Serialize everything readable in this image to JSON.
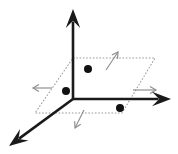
{
  "figure": {
    "background_color": "#ffffff",
    "width": 178,
    "height": 154
  },
  "chart_data": {
    "type": "scatter",
    "xlabel": "",
    "ylabel": "",
    "zlabel": "",
    "projection": "3d-oblique",
    "grid": false,
    "legend": null,
    "origin": {
      "x": 73,
      "y": 99
    },
    "axes": [
      {
        "name": "vertical-axis",
        "label": "",
        "color": "#1a1a1a",
        "from": {
          "x": 73,
          "y": 99
        },
        "to": {
          "x": 73,
          "y": 9
        },
        "arrow": "up",
        "style": "solid-thick"
      },
      {
        "name": "horizontal-axis",
        "label": "",
        "color": "#1a1a1a",
        "from": {
          "x": 73,
          "y": 99
        },
        "to": {
          "x": 171,
          "y": 99
        },
        "arrow": "right",
        "style": "solid-thick"
      },
      {
        "name": "depth-axis",
        "label": "",
        "color": "#1a1a1a",
        "from": {
          "x": 73,
          "y": 99
        },
        "to": {
          "x": 9,
          "y": 146
        },
        "arrow": "down-left",
        "style": "solid-thick"
      }
    ],
    "plane": {
      "name": "reference-plane",
      "style": "dotted",
      "color": "#9a9a9a",
      "vertices": [
        {
          "x": 73,
          "y": 58
        },
        {
          "x": 155,
          "y": 58
        },
        {
          "x": 122,
          "y": 113
        },
        {
          "x": 35,
          "y": 113
        }
      ]
    },
    "points": [
      {
        "label": "",
        "x": 88,
        "y": 69,
        "r": 4.0,
        "color": "#111111"
      },
      {
        "label": "",
        "x": 66,
        "y": 91,
        "r": 4.0,
        "color": "#111111"
      },
      {
        "label": "",
        "x": 120,
        "y": 108,
        "r": 4.0,
        "color": "#111111"
      }
    ],
    "direction_arrows": [
      {
        "name": "normal-arrow-upper-right",
        "from": {
          "x": 106,
          "y": 70
        },
        "to": {
          "x": 118,
          "y": 52
        },
        "color": "#8d8d8d"
      },
      {
        "name": "normal-arrow-left",
        "from": {
          "x": 52,
          "y": 88
        },
        "to": {
          "x": 33,
          "y": 88
        },
        "color": "#8d8d8d"
      },
      {
        "name": "normal-arrow-right",
        "from": {
          "x": 133,
          "y": 90
        },
        "to": {
          "x": 156,
          "y": 90
        },
        "color": "#8d8d8d"
      },
      {
        "name": "normal-arrow-lower",
        "from": {
          "x": 84,
          "y": 110
        },
        "to": {
          "x": 75,
          "y": 128
        },
        "color": "#8d8d8d"
      }
    ]
  }
}
